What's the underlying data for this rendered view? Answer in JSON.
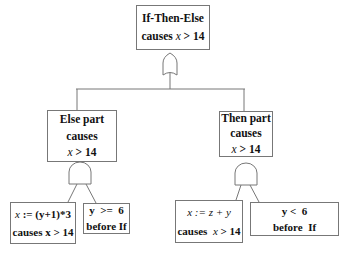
{
  "diagram": {
    "type": "fault-tree",
    "root": {
      "line1": "If-Then-Else",
      "line2_prefix": "causes ",
      "line2_var": "x",
      "line2_suffix": " > 14",
      "gate": "or-gate"
    },
    "else_node": {
      "line1": "Else part",
      "line2": "causes",
      "line3_var": "x",
      "line3_suffix": " > 14",
      "gate": "and-gate",
      "children": [
        {
          "line1_var": "x",
          "line1_suffix": " := (y+1)*3",
          "line2": "causes x > 14"
        },
        {
          "line1": "y  >=  6",
          "line2": "before If"
        }
      ]
    },
    "then_node": {
      "line1": "Then part",
      "line2": "causes",
      "line3_var": "x",
      "line3_suffix": " > 14",
      "gate": "and-gate",
      "children": [
        {
          "line1_var": "x",
          "line1_suffix": " := z + y",
          "line2_prefix": "causes  ",
          "line2_var": "x",
          "line2_suffix": " > 14"
        },
        {
          "line1": "y <  6",
          "line2": "before  If"
        }
      ]
    },
    "colors": {
      "line": "#777777",
      "text": "#111111",
      "background": "#ffffff"
    }
  }
}
